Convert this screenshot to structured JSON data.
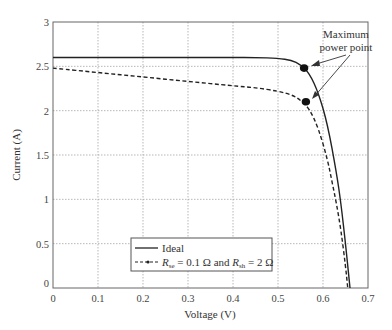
{
  "chart_data": {
    "type": "line",
    "title": "",
    "xlabel": "Voltage (V)",
    "ylabel": "Current (A)",
    "xlim": [
      0,
      0.7
    ],
    "ylim": [
      0,
      3
    ],
    "xticks": [
      "0",
      "0.1",
      "0.2",
      "0.3",
      "0.4",
      "0.5",
      "0.6",
      "0.7"
    ],
    "yticks": [
      "0",
      "0.5",
      "1",
      "1.5",
      "2",
      "2.5",
      "3"
    ],
    "grid": true,
    "legend_position": "lower center",
    "series": [
      {
        "name": "Ideal",
        "style": "solid",
        "x": [
          0,
          0.1,
          0.2,
          0.3,
          0.4,
          0.45,
          0.5,
          0.53,
          0.55,
          0.57,
          0.59,
          0.61,
          0.63,
          0.64,
          0.65,
          0.655,
          0.66
        ],
        "y": [
          2.6,
          2.6,
          2.6,
          2.6,
          2.6,
          2.6,
          2.59,
          2.57,
          2.52,
          2.42,
          2.2,
          1.85,
          1.3,
          0.95,
          0.5,
          0.25,
          0
        ]
      },
      {
        "name": "R_se = 0.1 Ω and R_sh = 2 Ω",
        "style": "dashed",
        "x": [
          0,
          0.1,
          0.2,
          0.3,
          0.4,
          0.45,
          0.5,
          0.53,
          0.55,
          0.57,
          0.59,
          0.61,
          0.62,
          0.63,
          0.64,
          0.65,
          0.655
        ],
        "y": [
          2.48,
          2.43,
          2.38,
          2.33,
          2.28,
          2.26,
          2.22,
          2.18,
          2.12,
          2.02,
          1.8,
          1.45,
          1.2,
          0.95,
          0.65,
          0.25,
          0
        ]
      }
    ],
    "annotations": [
      {
        "text": "Maximum power point",
        "points": [
          {
            "series": "Ideal",
            "x": 0.558,
            "y": 2.48
          },
          {
            "series": "R_se = 0.1 Ω and R_sh = 2 Ω",
            "x": 0.562,
            "y": 2.1
          }
        ]
      }
    ]
  },
  "labels": {
    "xlabel": "Voltage (V)",
    "ylabel": "Current (A)",
    "annotation_line1": "Maximum",
    "annotation_line2": "power point",
    "legend_ideal": "Ideal",
    "legend_r_prefix": "R",
    "legend_se_sub": "se",
    "legend_mid": " = 0.1 Ω and ",
    "legend_r2_prefix": "R",
    "legend_sh_sub": "sh",
    "legend_end": " = 2 Ω"
  },
  "colors": {
    "line": "#222222",
    "grid": "#9a9a9a",
    "axis": "#666666"
  }
}
